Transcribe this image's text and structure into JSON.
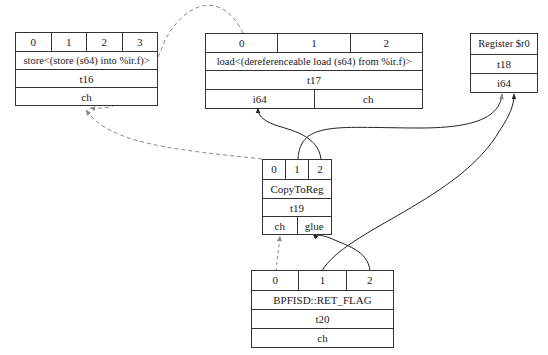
{
  "nodes": {
    "t16": {
      "ports": [
        "0",
        "1",
        "2",
        "3"
      ],
      "label": "store<(store (s64) into %ir.f)>",
      "id": "t16",
      "outputs": [
        "ch"
      ]
    },
    "t17": {
      "ports": [
        "0",
        "1",
        "2"
      ],
      "label": "load<(dereferenceable load (s64) from %ir.f)>",
      "id": "t17",
      "outputs": [
        "i64",
        "ch"
      ]
    },
    "t18": {
      "label": "Register $r0",
      "id": "t18",
      "outputs": [
        "i64"
      ]
    },
    "t19": {
      "ports": [
        "0",
        "1",
        "2"
      ],
      "label": "CopyToReg",
      "id": "t19",
      "outputs": [
        "ch",
        "glue"
      ]
    },
    "t20": {
      "ports": [
        "0",
        "1",
        "2"
      ],
      "label": "BPFISD::RET_FLAG",
      "id": "t20",
      "outputs": [
        "ch"
      ]
    }
  },
  "edges": [
    {
      "from": "t17.port0",
      "to": "t16.ch",
      "style": "dashed"
    },
    {
      "from": "t19.port0",
      "to": "t16.ch",
      "style": "dashed"
    },
    {
      "from": "t19.port1",
      "to": "t18.i64",
      "style": "solid"
    },
    {
      "from": "t19.port2",
      "to": "t17.i64",
      "style": "solid"
    },
    {
      "from": "t20.port0",
      "to": "t19.ch",
      "style": "dashed"
    },
    {
      "from": "t20.port1",
      "to": "t18.i64",
      "style": "solid"
    },
    {
      "from": "t20.port2",
      "to": "t19.glue",
      "style": "solid"
    }
  ],
  "colors": {
    "line": "#333333",
    "dashed": "#888888",
    "background": "#ffffff"
  }
}
